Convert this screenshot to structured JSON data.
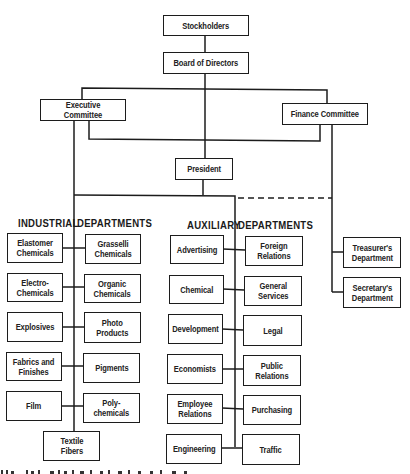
{
  "chart": {
    "nodes": {
      "stockholders": "Stockholders",
      "board": "Board of Directors",
      "executive_committee": "Executive Committee",
      "finance_committee": "Finance Committee",
      "president": "President",
      "treasurer": "Treasurer's\nDepartment",
      "secretary": "Secretary's\nDepartment"
    },
    "headers": {
      "industrial_left": "INDUSTRIAL",
      "industrial_right": "DEPARTMENTS",
      "auxiliary_left": "AUXILIARY",
      "auxiliary_right": "DEPARTMENTS"
    },
    "industrial_departments": [
      "Elastomer\nChemicals",
      "Grasselli\nChemicals",
      "Electro-\nChemicals",
      "Organic\nChemicals",
      "Explosives",
      "Photo\nProducts",
      "Fabrics and\nFinishes",
      "Pigments",
      "Film",
      "Poly-\nchemicals",
      "Textile\nFibers"
    ],
    "auxiliary_departments": [
      "Advertising",
      "Foreign\nRelations",
      "Chemical",
      "General\nServices",
      "Development",
      "Legal",
      "Economists",
      "Public\nRelations",
      "Employee\nRelations",
      "Purchasing",
      "Engineering",
      "Traffic"
    ],
    "line_color": "#1c1c1c"
  }
}
